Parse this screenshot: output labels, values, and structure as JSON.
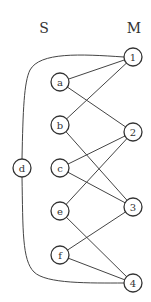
{
  "diagram": {
    "set_labels": {
      "left": "S",
      "right": "M"
    },
    "nodes": {
      "a": {
        "label": "a",
        "x": 60,
        "y": 82
      },
      "b": {
        "label": "b",
        "x": 60,
        "y": 125
      },
      "c": {
        "label": "c",
        "x": 60,
        "y": 168
      },
      "d": {
        "label": "d",
        "x": 22,
        "y": 168
      },
      "e": {
        "label": "e",
        "x": 60,
        "y": 211
      },
      "f": {
        "label": "f",
        "x": 60,
        "y": 255
      },
      "n1": {
        "label": "1",
        "x": 133,
        "y": 57
      },
      "n2": {
        "label": "2",
        "x": 133,
        "y": 132
      },
      "n3": {
        "label": "3",
        "x": 133,
        "y": 207
      },
      "n4": {
        "label": "4",
        "x": 133,
        "y": 283
      }
    },
    "edges": [
      [
        "a",
        "1"
      ],
      [
        "a",
        "2"
      ],
      [
        "b",
        "1"
      ],
      [
        "b",
        "3"
      ],
      [
        "c",
        "2"
      ],
      [
        "c",
        "3"
      ],
      [
        "e",
        "2"
      ],
      [
        "e",
        "4"
      ],
      [
        "f",
        "3"
      ],
      [
        "f",
        "4"
      ],
      [
        "d",
        "1"
      ],
      [
        "d",
        "4"
      ]
    ]
  }
}
